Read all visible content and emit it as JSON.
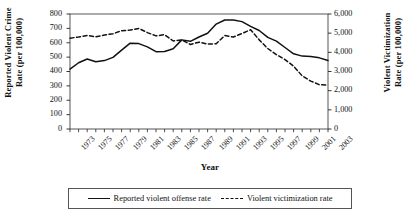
{
  "chart_data": {
    "type": "line",
    "title": "",
    "xlabel": "Year",
    "ylabel": "Reported Violent Crime Rate (per 100,000)",
    "ylabel_right": "Violent Victimization Rate (per 100,000)",
    "grid": false,
    "legend_position": "bottom",
    "x": [
      1973,
      1974,
      1975,
      1976,
      1977,
      1978,
      1979,
      1980,
      1981,
      1982,
      1983,
      1984,
      1985,
      1986,
      1987,
      1988,
      1989,
      1990,
      1991,
      1992,
      1993,
      1994,
      1995,
      1996,
      1997,
      1998,
      1999,
      2000,
      2001,
      2002,
      2003
    ],
    "xtick_labels": [
      "1973",
      "1975",
      "1977",
      "1979",
      "1981",
      "1983",
      "1985",
      "1987",
      "1989",
      "1991",
      "1993",
      "1995",
      "1997",
      "1999",
      "2001",
      "2003"
    ],
    "ylim": [
      0,
      800
    ],
    "ytick_labels": [
      "0",
      "100",
      "200",
      "300",
      "400",
      "500",
      "600",
      "700",
      "800"
    ],
    "ylim_right": [
      0,
      6000
    ],
    "ytick_labels_right": [
      "0",
      "1,000",
      "2,000",
      "3,000",
      "4,000",
      "5,000",
      "6,000"
    ],
    "series": [
      {
        "name": "Reported violent offense rate",
        "style": "solid",
        "axis": "left",
        "color": "#111111",
        "values": [
          417,
          461,
          487,
          468,
          476,
          498,
          549,
          597,
          594,
          571,
          538,
          539,
          558,
          620,
          610,
          640,
          666,
          730,
          758,
          758,
          747,
          714,
          685,
          637,
          611,
          567,
          523,
          507,
          505,
          495,
          476
        ]
      },
      {
        "name": "Violent victimization rate",
        "style": "dashed",
        "axis": "right",
        "color": "#111111",
        "values": [
          4740,
          4800,
          4880,
          4810,
          4900,
          4970,
          5130,
          5160,
          5250,
          5030,
          4860,
          4920,
          4590,
          4650,
          4410,
          4530,
          4430,
          4450,
          4880,
          4800,
          4980,
          5180,
          4650,
          4200,
          3880,
          3620,
          3280,
          2770,
          2500,
          2310,
          2290
        ]
      }
    ]
  },
  "axes": {
    "left_title_line1": "Reported Violent Crime",
    "left_title_line2": "Rate (per 100,000)",
    "right_title_line1": "Violent Victimization",
    "right_title_line2": "Rate (per 100,000)",
    "x_title": "Year"
  },
  "legend": {
    "items": [
      {
        "label": "Reported violent offense rate",
        "style": "solid"
      },
      {
        "label": "Violent victimization rate",
        "style": "dashed"
      }
    ]
  }
}
